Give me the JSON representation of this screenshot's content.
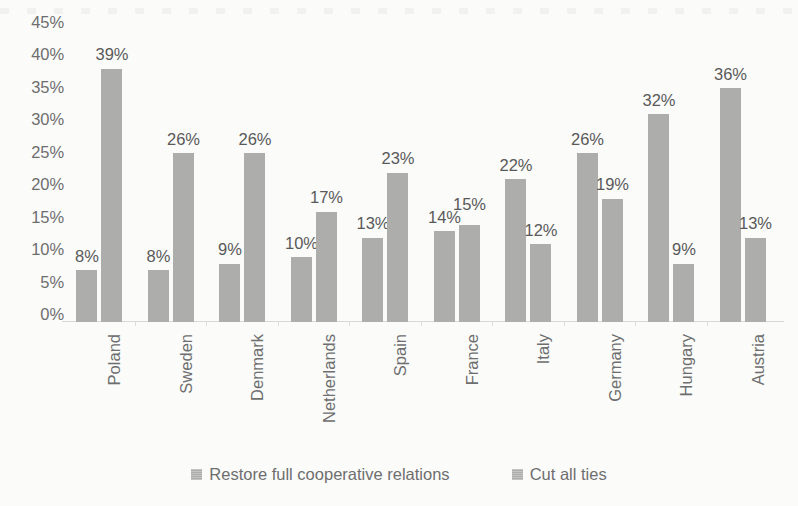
{
  "chart_data": {
    "type": "bar",
    "title": "",
    "subtitle": "",
    "xlabel": "",
    "ylabel": "",
    "ylim": [
      0,
      45
    ],
    "ytick_labels": [
      "45%",
      "40%",
      "35%",
      "30%",
      "25%",
      "20%",
      "15%",
      "10%",
      "5%",
      "0%"
    ],
    "ytick_values": [
      45,
      40,
      35,
      30,
      25,
      20,
      15,
      10,
      5,
      0
    ],
    "grid": false,
    "legend_position": "bottom",
    "categories": [
      "Poland",
      "Sweden",
      "Denmark",
      "Netherlands",
      "Spain",
      "France",
      "Italy",
      "Germany",
      "Hungary",
      "Austria"
    ],
    "series": [
      {
        "name": "Restore full cooperative relations",
        "color": "#adadab",
        "values": [
          8,
          8,
          9,
          10,
          13,
          14,
          22,
          26,
          32,
          36
        ],
        "data_labels": [
          "8%",
          "8%",
          "9%",
          "10%",
          "13%",
          "14%",
          "22%",
          "26%",
          "32%",
          "36%"
        ]
      },
      {
        "name": "Cut all ties",
        "color": "#adadab",
        "values": [
          39,
          26,
          26,
          17,
          23,
          15,
          12,
          19,
          9,
          13
        ],
        "data_labels": [
          "39%",
          "26%",
          "26%",
          "17%",
          "23%",
          "15%",
          "12%",
          "19%",
          "9%",
          "13%"
        ]
      }
    ]
  },
  "legend": {
    "items": [
      {
        "label": "Restore full cooperative relations",
        "swatch_icon": "square-swatch-icon"
      },
      {
        "label": "Cut all ties",
        "swatch_icon": "square-swatch-icon"
      }
    ]
  },
  "colors": {
    "background": "#fbfbfa",
    "bar": "#adadab",
    "axis_text": "#6e6e6e",
    "label_text": "#595959",
    "baseline": "#d7d7d5"
  }
}
